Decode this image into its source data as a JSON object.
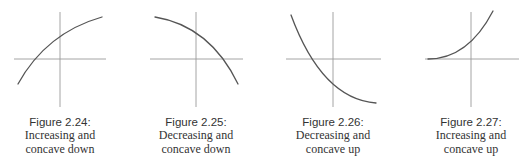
{
  "figures": [
    {
      "label": "Figure 2.24:",
      "line1": "Increasing and",
      "line2": "concave down",
      "description": "Increasing and concave down",
      "center_x": 60,
      "axes": {
        "x1": 14,
        "x2": 106,
        "y_axis_x": 60,
        "h_y": 59,
        "v_y1": 12,
        "v_y2": 107
      },
      "curve": "M18,84 Q46,33 102,17"
    },
    {
      "label": "Figure 2.25:",
      "line1": "Decreasing and",
      "line2": "concave down",
      "description": "Decreasing and concave down",
      "center_x": 196,
      "axes": {
        "x1": 150,
        "x2": 243,
        "y_axis_x": 196,
        "h_y": 59,
        "v_y1": 12,
        "v_y2": 107
      },
      "curve": "M155,17 Q210,26 238,84"
    },
    {
      "label": "Figure 2.26:",
      "line1": "Decreasing and",
      "line2": "concave up",
      "description": "Decreasing and concave up",
      "center_x": 333,
      "axes": {
        "x1": 286,
        "x2": 381,
        "y_axis_x": 333,
        "h_y": 59,
        "v_y1": 12,
        "v_y2": 107
      },
      "curve": "M291,15 Q322,99 376,103"
    },
    {
      "label": "Figure 2.27:",
      "line1": "Increasing and",
      "line2": "concave up",
      "description": "Increasing and concave up",
      "center_x": 471,
      "axes": {
        "x1": 425,
        "x2": 519,
        "y_axis_x": 471,
        "h_y": 59,
        "v_y1": 12,
        "v_y2": 107
      },
      "curve": "M428,59 Q468,59 493,11"
    }
  ],
  "colors": {
    "axis": "#9a9a9a",
    "curve": "#555555",
    "text": "#333333",
    "background": "#ffffff"
  }
}
